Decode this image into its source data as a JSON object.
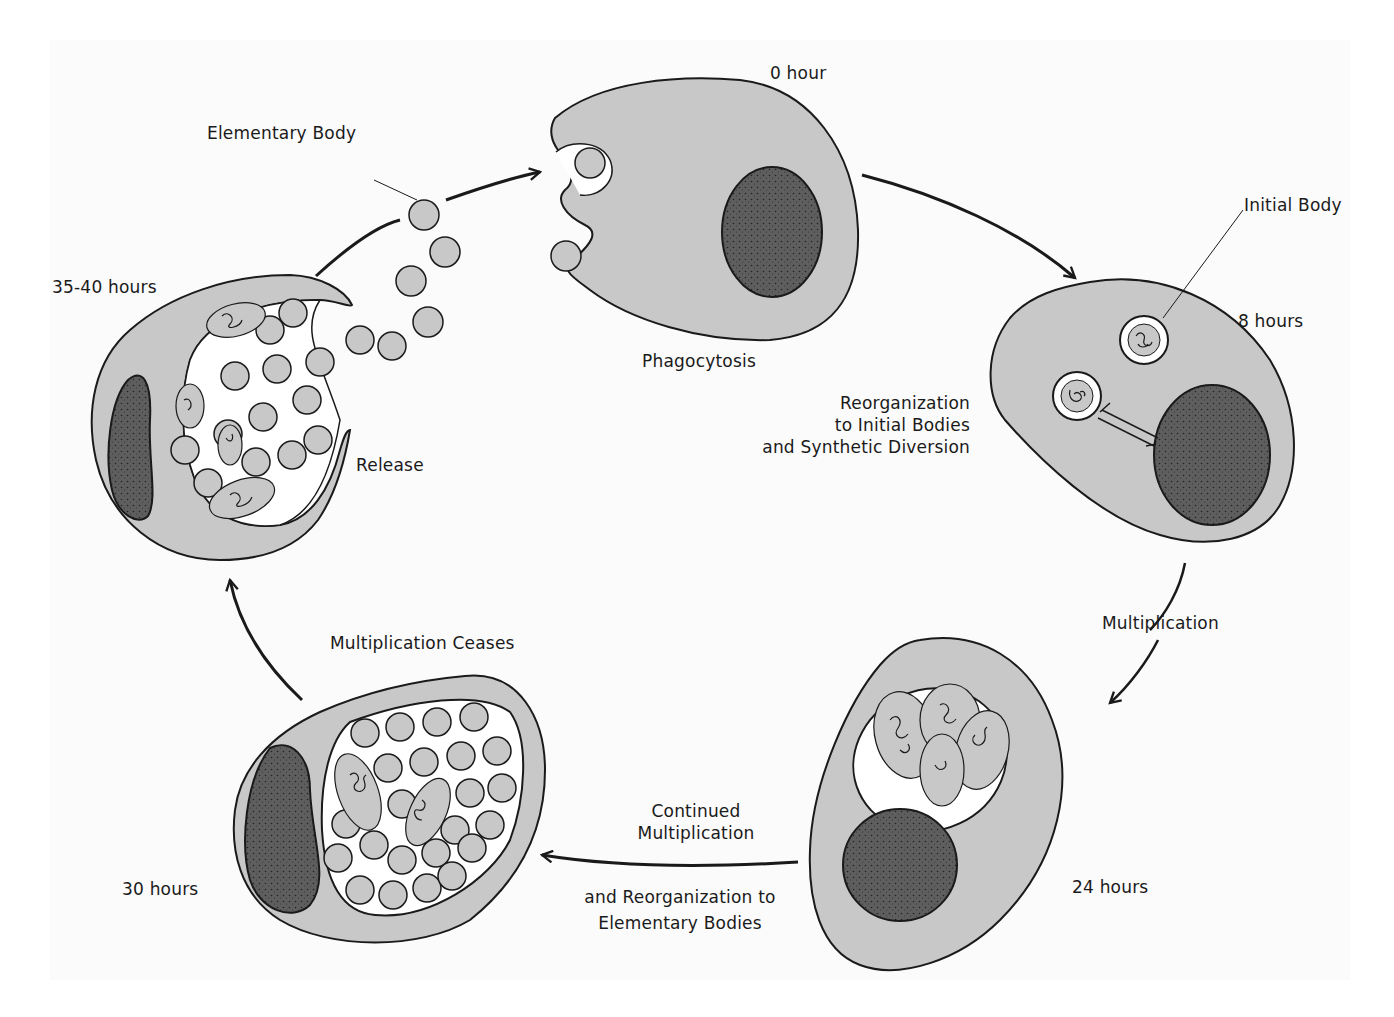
{
  "colors": {
    "cytoplasm": "#c8c8c8",
    "nucleus": "#5a5a5a",
    "outline": "#1a1a1a",
    "inclusion": "#ffffff",
    "background": "#ffffff"
  },
  "stages": [
    {
      "id": "0h",
      "time": "0 hour",
      "process": "Phagocytosis"
    },
    {
      "id": "8h",
      "time": "8 hours",
      "process": "Reorganization to Initial Bodies and Synthetic Diversion"
    },
    {
      "id": "24h",
      "time": "24 hours",
      "process": "Multiplication"
    },
    {
      "id": "30h",
      "time": "30 hours",
      "process": "Continued Multiplication and Reorganization to Elementary Bodies"
    },
    {
      "id": "35-40h",
      "time": "35-40 hours",
      "process": "Multiplication Ceases"
    },
    {
      "id": "release",
      "time": "",
      "process": "Release"
    }
  ],
  "labels": {
    "elementary_body": "Elementary Body",
    "initial_body": "Initial Body",
    "time_0": "0 hour",
    "time_8": "8 hours",
    "time_24": "24 hours",
    "time_30": "30 hours",
    "time_35_40": "35-40 hours",
    "phagocytosis": "Phagocytosis",
    "reorganization": [
      "Reorganization",
      "to Initial Bodies",
      "and Synthetic Diversion"
    ],
    "multiplication": "Multiplication",
    "continued": [
      "Continued",
      "Multiplication"
    ],
    "reorg_elementary": [
      "and Reorganization to",
      "Elementary Bodies"
    ],
    "multiplication_ceases": "Multiplication Ceases",
    "release": "Release"
  }
}
